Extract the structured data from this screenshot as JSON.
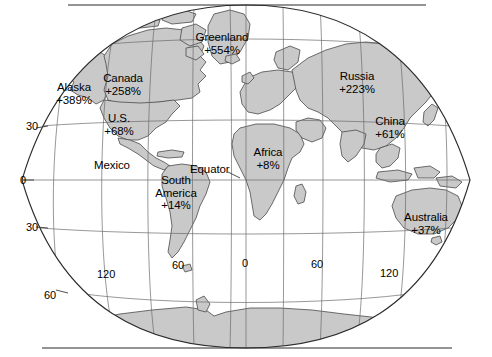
{
  "map": {
    "title": "World map of percentage change by region",
    "projection": "elliptical (Mollweide-like) world projection",
    "land_fill_color": "#c9c9c9",
    "outline_color": "#4a4a4a",
    "graticule_color": "#6b6b6b",
    "background_color": "#ffffff",
    "equator_label": "Equator",
    "region_labels": [
      {
        "name": "greenland",
        "line1": "Greenland",
        "line2": "+554%",
        "value": 554,
        "x": 222,
        "y": 31
      },
      {
        "name": "canada",
        "line1": "Canada",
        "line2": "+258%",
        "value": 258,
        "x": 123,
        "y": 72
      },
      {
        "name": "alaska",
        "line1": "Alaska",
        "line2": "+389%",
        "value": 389,
        "x": 74,
        "y": 81
      },
      {
        "name": "russia",
        "line1": "Russia",
        "line2": "+223%",
        "value": 223,
        "x": 357,
        "y": 70
      },
      {
        "name": "united-states",
        "line1": "U.S.",
        "line2": "+68%",
        "value": 68,
        "x": 119,
        "y": 112
      },
      {
        "name": "china",
        "line1": "China",
        "line2": "+61%",
        "value": 61,
        "x": 390,
        "y": 115
      },
      {
        "name": "mexico",
        "line1": "Mexico",
        "line2": "",
        "value": null,
        "x": 112,
        "y": 159
      },
      {
        "name": "africa",
        "line1": "Africa",
        "line2": "+8%",
        "value": 8,
        "x": 268,
        "y": 146
      },
      {
        "name": "south-america",
        "line1": "South",
        "line2": "America",
        "line3": "+14%",
        "value": 14,
        "x": 176,
        "y": 174
      },
      {
        "name": "australia",
        "line1": "Australia",
        "line2": "+37%",
        "value": 37,
        "x": 426,
        "y": 211
      }
    ],
    "latitude_labels": [
      {
        "text": "30",
        "x": 26,
        "y": 126
      },
      {
        "text": "0",
        "x": 20,
        "y": 174
      },
      {
        "text": "30",
        "x": 26,
        "y": 221
      },
      {
        "text": "60",
        "x": 44,
        "y": 289
      }
    ],
    "longitude_labels": [
      {
        "text": "120",
        "x": 97,
        "y": 268
      },
      {
        "text": "60",
        "x": 172,
        "y": 259
      },
      {
        "text": "0",
        "x": 242,
        "y": 257
      },
      {
        "text": "60",
        "x": 311,
        "y": 258
      },
      {
        "text": "120",
        "x": 380,
        "y": 267
      }
    ]
  }
}
